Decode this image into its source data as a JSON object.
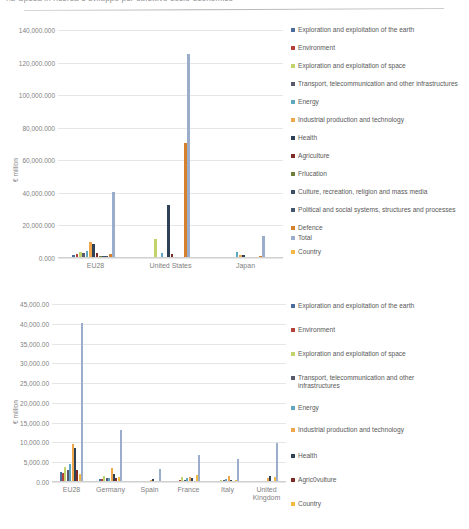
{
  "page": {
    "top_caption": "4.2    Spesa in ricerca e sviluppo per obiettivo socio-economico"
  },
  "series_colors": {
    "exploration_earth": "#4a6d9e",
    "environment": "#b5413b",
    "exploration_space": "#c3d36b",
    "transport": "#5a5a6e",
    "energy": "#5fa8bf",
    "industrial": "#f0a64a",
    "health": "#2f4156",
    "agriculture": "#7d2c26",
    "education": "#6f7f3a",
    "culture": "#3e4f6b",
    "political": "#44566f",
    "defence": "#d4802c",
    "total": "#9aaecb",
    "country": "#f5b942"
  },
  "chart_data": [
    {
      "id": "chart-top",
      "type": "bar",
      "title": "",
      "xlabel": "",
      "ylabel": "€ million",
      "ylim": [
        0,
        140000.0
      ],
      "ytick_labels": [
        "140,000.000",
        "120,000.000",
        "100,000.000",
        "80,000.000",
        "60,000.000",
        "40,000.000",
        "20,000.000",
        "0.000"
      ],
      "ytick_values": [
        140000.0,
        120000.0,
        100000.0,
        80000.0,
        60000.0,
        40000.0,
        20000.0,
        0.0
      ],
      "grid": true,
      "legend_position": "right",
      "categories": [
        "EU28",
        "United States",
        "Japan"
      ],
      "series": [
        {
          "name": "Exploration and exploitation of the earth",
          "color_key": "exploration_earth",
          "values": [
            1600,
            900,
            400
          ]
        },
        {
          "name": "Environment",
          "color_key": "environment",
          "values": [
            2400,
            700,
            300
          ]
        },
        {
          "name": "Exploration and exploitation of space",
          "color_key": "exploration_space",
          "values": [
            3900,
            11800,
            600
          ]
        },
        {
          "name": "Transport, telecommunication and other infrastructures",
          "color_key": "transport",
          "values": [
            3100,
            900,
            700
          ]
        },
        {
          "name": "Energy",
          "color_key": "energy",
          "values": [
            4600,
            3300,
            3400
          ]
        },
        {
          "name": "Industrial production and technology",
          "color_key": "industrial",
          "values": [
            9700,
            600,
            1800
          ]
        },
        {
          "name": "Health",
          "color_key": "health",
          "values": [
            8500,
            32400,
            1700
          ]
        },
        {
          "name": "Agriculture",
          "color_key": "agriculture",
          "values": [
            3200,
            2200,
            900
          ]
        },
        {
          "name": "Education",
          "color_key": "education",
          "values": [
            1200,
            400,
            300
          ]
        },
        {
          "name": "Culture, recreation, religion and mass media",
          "color_key": "culture",
          "values": [
            1500,
            300,
            400
          ]
        },
        {
          "name": "Political and social systems, structures and processes",
          "color_key": "political",
          "values": [
            1400,
            300,
            300
          ]
        },
        {
          "name": "Defence",
          "color_key": "defence",
          "values": [
            2600,
            70700,
            1100
          ]
        },
        {
          "name": "Total",
          "color_key": "total",
          "values": [
            40400,
            125000,
            13500
          ]
        },
        {
          "name": "Country",
          "color_key": "country",
          "values": [
            600,
            400,
            300
          ]
        }
      ]
    },
    {
      "id": "chart-bottom",
      "type": "bar",
      "title": "",
      "xlabel": "",
      "ylabel": "€ million",
      "ylim": [
        0,
        45000.0
      ],
      "ytick_labels": [
        "45,000.00",
        "40,000.00",
        "35,000.00",
        "30,000.00",
        "25,000.00",
        "20,000.00",
        "15,000.00",
        "10,000.00",
        "5,000.00",
        "0.00"
      ],
      "ytick_values": [
        45000.0,
        40000.0,
        35000.0,
        30000.0,
        25000.0,
        20000.0,
        15000.0,
        10000.0,
        5000.0,
        0.0
      ],
      "grid": true,
      "legend_position": "right",
      "categories": [
        "EU28",
        "Germany",
        "Spain",
        "France",
        "Italy",
        "United Kingdom"
      ],
      "series": [
        {
          "name": "Exploration and exploitation of the earth",
          "color_key": "exploration_earth",
          "values": [
            2450,
            700,
            120,
            330,
            200,
            180
          ]
        },
        {
          "name": "Environment",
          "color_key": "environment",
          "values": [
            2400,
            800,
            180,
            420,
            260,
            200
          ]
        },
        {
          "name": "Exploration and exploitation of space",
          "color_key": "exploration_space",
          "values": [
            3900,
            1400,
            150,
            1250,
            560,
            360
          ]
        },
        {
          "name": "Transport, telecommunication and other infrastructures",
          "color_key": "transport",
          "values": [
            3100,
            1000,
            200,
            500,
            420,
            300
          ]
        },
        {
          "name": "Energy",
          "color_key": "energy",
          "values": [
            4600,
            900,
            300,
            980,
            740,
            260
          ]
        },
        {
          "name": "Industrial production and technology",
          "color_key": "industrial",
          "values": [
            9700,
            3500,
            420,
            1300,
            1500,
            900
          ]
        },
        {
          "name": "Health",
          "color_key": "health",
          "values": [
            8500,
            2000,
            700,
            1100,
            600,
            1400
          ]
        },
        {
          "name": "Agric0vulture",
          "color_key": "agriculture",
          "values": [
            3000,
            1000,
            380,
            300,
            300,
            300
          ]
        },
        {
          "name": "Country",
          "color_key": "country",
          "values": [
            2000,
            1200,
            250,
            1650,
            420,
            1350
          ]
        },
        {
          "name": "Total-series",
          "color_key": "total",
          "values": [
            40300,
            13200,
            3400,
            6900,
            5700,
            9800
          ]
        }
      ]
    }
  ],
  "legends": [
    {
      "id": "legend-top",
      "items": [
        {
          "label": "Exploration and exploitation of the earth",
          "color_key": "exploration_earth"
        },
        {
          "label": "Environment",
          "color_key": "environment"
        },
        {
          "label": "Exploration and exploitation of space",
          "color_key": "exploration_space"
        },
        {
          "label": "Transport, telecommunication and other infrastructures",
          "color_key": "transport"
        },
        {
          "label": "Energy",
          "color_key": "energy"
        },
        {
          "label": "Industrial production and technology",
          "color_key": "industrial"
        },
        {
          "label": "Health",
          "color_key": "health"
        },
        {
          "label": "Agriculture",
          "color_key": "agriculture"
        },
        {
          "label": "Frlucation",
          "color_key": "education"
        },
        {
          "label": "Culture, recreation, religion and mass media",
          "color_key": "culture"
        },
        {
          "label": "Political and social systems, structures and processes",
          "color_key": "political"
        },
        {
          "label": "Defence",
          "color_key": "defence"
        },
        {
          "label": "Total",
          "color_key": "total"
        },
        {
          "label": "Country",
          "color_key": "country"
        }
      ]
    },
    {
      "id": "legend-bottom",
      "items": [
        {
          "label": "Exploration and exploitation of the earth",
          "color_key": "exploration_earth"
        },
        {
          "label": "Environment",
          "color_key": "environment"
        },
        {
          "label": "Exploration and exploitation of space",
          "color_key": "exploration_space"
        },
        {
          "label": "Transport, telecommunication and other infrastructures",
          "color_key": "transport"
        },
        {
          "label": "Energy",
          "color_key": "energy"
        },
        {
          "label": "Industrial production and technology",
          "color_key": "industrial"
        },
        {
          "label": "Health",
          "color_key": "health"
        },
        {
          "label": "Agric0vulture",
          "color_key": "agriculture"
        },
        {
          "label": "Country",
          "color_key": "country"
        }
      ]
    }
  ]
}
